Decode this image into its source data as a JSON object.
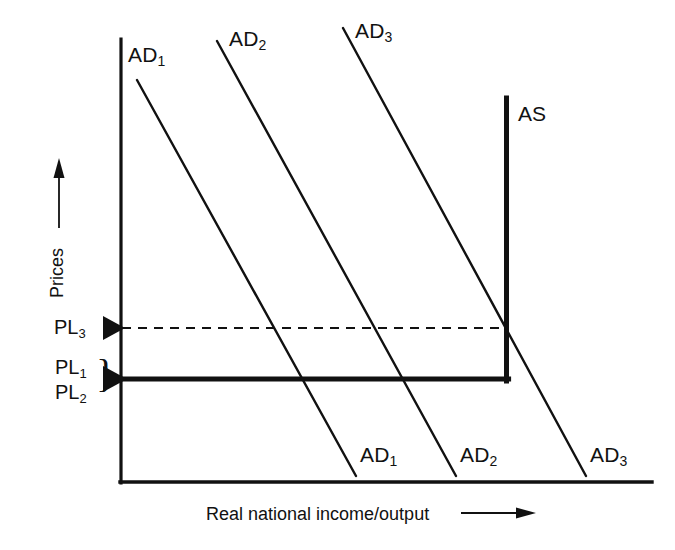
{
  "figure": {
    "background_color": "#ffffff",
    "line_color": "#111111"
  },
  "axes": {
    "y_axis_label": "Prices",
    "y_axis_arrow": "up-arrow",
    "x_axis_label": "Real national income/output",
    "x_axis_arrow": "right-arrow",
    "origin_x": 120,
    "origin_y": 483,
    "x_axis_end": 652,
    "y_axis_top": 39
  },
  "curves": {
    "aggregate_demand": [
      {
        "name": "AD1",
        "label_top": "AD",
        "label_top_sub": "1",
        "label_bottom": "AD",
        "label_bottom_sub": "1",
        "x1": 137,
        "y1": 80,
        "x2": 356,
        "y2": 476
      },
      {
        "name": "AD2",
        "label_top": "AD",
        "label_top_sub": "2",
        "label_bottom": "AD",
        "label_bottom_sub": "2",
        "x1": 217,
        "y1": 41,
        "x2": 456,
        "y2": 476
      },
      {
        "name": "AD3",
        "label_top": "AD",
        "label_top_sub": "3",
        "label_bottom": "AD",
        "label_bottom_sub": "3",
        "x1": 343,
        "y1": 28,
        "x2": 586,
        "y2": 476
      }
    ],
    "aggregate_supply": {
      "name": "AS",
      "label": "AS",
      "vertical_x": 507,
      "vertical_top_y": 98,
      "corner_y": 379,
      "horizontal_start_x": 120
    }
  },
  "price_levels": [
    {
      "label": "PL",
      "sub": "3",
      "y": 328,
      "line_style": "dashed",
      "marker": "triangle-right"
    },
    {
      "label": "PL",
      "sub": "1",
      "y": 368,
      "line_style": "solid-thick",
      "marker": "triangle-right"
    },
    {
      "label": "PL",
      "sub": "2",
      "y": 393,
      "line_style": "solid-thick",
      "marker": "triangle-right"
    }
  ],
  "brace": {
    "glyph": "}",
    "groups": [
      "PL1",
      "PL2"
    ]
  },
  "dashed_line": {
    "from_x": 120,
    "to_x": 507,
    "y": 328,
    "dash_pattern": "9 7"
  }
}
